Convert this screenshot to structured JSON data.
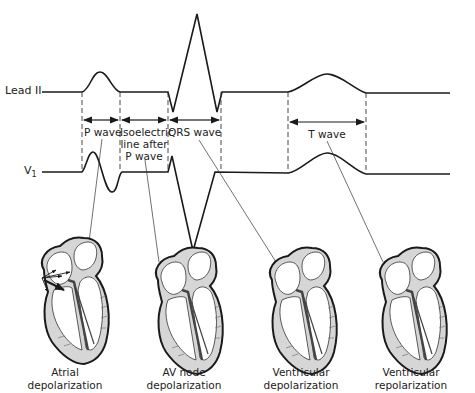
{
  "leads": {
    "lead_ii": "Lead II",
    "v1_main": "V",
    "v1_sub": "1"
  },
  "intervals": {
    "p_wave": "P wave",
    "isoelectric_1": "Isoelectric",
    "isoelectric_2": "line after",
    "isoelectric_3": "P wave",
    "qrs_wave": "QRS wave",
    "t_wave": "T wave"
  },
  "hearts": [
    {
      "line1": "Atrial",
      "line2": "depolarization"
    },
    {
      "line1": "AV node",
      "line2": "depolarization"
    },
    {
      "line1": "Ventricular",
      "line2": "depolarization"
    },
    {
      "line1": "Ventricular",
      "line2": "repolarization"
    }
  ],
  "colors": {
    "line": "#1a1a1a",
    "heart_fill": "#d9d9d9",
    "conduction": "#444444"
  }
}
